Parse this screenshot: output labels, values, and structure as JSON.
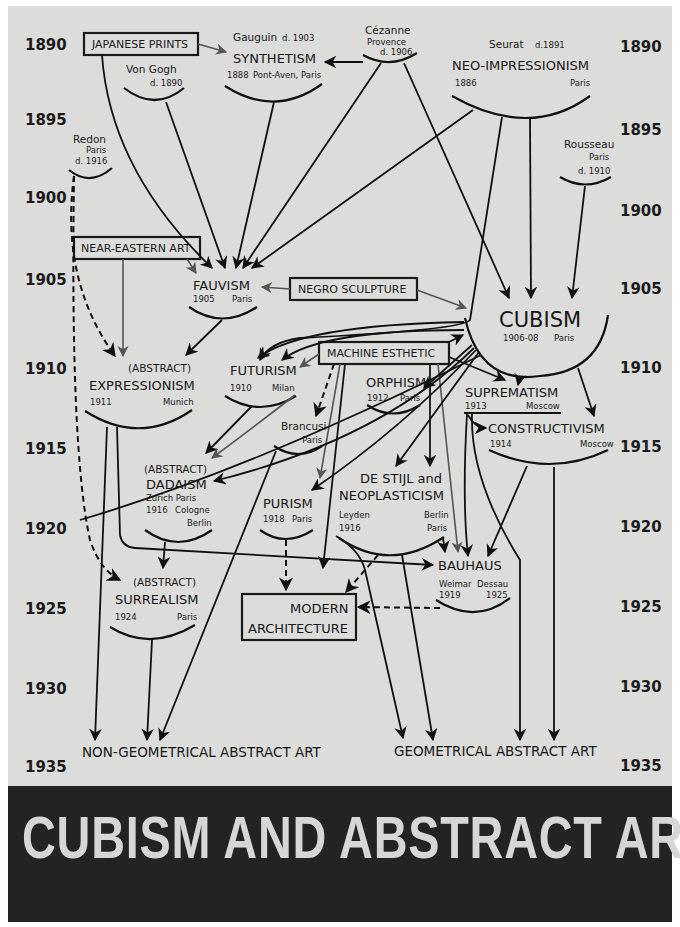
{
  "cover": {
    "title": "CUBISM AND ABSTRACT ART",
    "background_color": "#dcdcda",
    "banner_color": "#232323",
    "title_color": "#d6d6d6"
  },
  "timeline": {
    "left_years": [
      "1890",
      "1895",
      "1900",
      "1905",
      "1910",
      "1915",
      "1920",
      "1925",
      "1930",
      "1935"
    ],
    "right_years": [
      "1890",
      "1895",
      "1900",
      "1905",
      "1910",
      "1915",
      "1920",
      "1925",
      "1930",
      "1935"
    ]
  },
  "external_influences": [
    {
      "id": "japanese_prints",
      "label": "JAPANESE PRINTS"
    },
    {
      "id": "near_eastern_art",
      "label": "NEAR-EASTERN ART"
    },
    {
      "id": "negro_sculpture",
      "label": "NEGRO SCULPTURE"
    },
    {
      "id": "machine_esthetic",
      "label": "MACHINE ESTHETIC"
    },
    {
      "id": "modern_architecture",
      "label_line1": "MODERN",
      "label_line2": "ARCHITECTURE"
    }
  ],
  "artists": {
    "van_gogh": {
      "name": "Von Gogh",
      "detail": "d. 1890"
    },
    "gauguin": {
      "name": "Gauguin",
      "detail": "d. 1903"
    },
    "cezanne": {
      "name": "Cézanne",
      "place": "Provence",
      "detail": "d. 1906"
    },
    "seurat": {
      "name": "Seurat",
      "detail": "d.1891"
    },
    "redon": {
      "name": "Redon",
      "place": "Paris",
      "detail": "d. 1916"
    },
    "rousseau": {
      "name": "Rousseau",
      "place": "Paris",
      "detail": "d. 1910"
    },
    "brancusi": {
      "name": "Brancusi",
      "place": "Paris"
    }
  },
  "movements": {
    "synthetism": {
      "name": "SYNTHETISM",
      "year": "1888",
      "place": "Pont-Aven, Paris"
    },
    "neo_impressionism": {
      "name": "NEO-IMPRESSIONISM",
      "year": "1886",
      "place": "Paris"
    },
    "fauvism": {
      "name": "FAUVISM",
      "year": "1905",
      "place": "Paris"
    },
    "cubism": {
      "name": "CUBISM",
      "year": "1906-08",
      "place": "Paris"
    },
    "expressionism": {
      "prefix": "(ABSTRACT)",
      "name": "EXPRESSIONISM",
      "year": "1911",
      "place": "Munich"
    },
    "futurism": {
      "name": "FUTURISM",
      "year": "1910",
      "place": "Milan"
    },
    "orphism": {
      "name": "ORPHISM",
      "year": "1912",
      "place": "Paris"
    },
    "suprematism": {
      "name": "SUPREMATISM",
      "year": "1913",
      "place": "Moscow"
    },
    "constructivism": {
      "name": "CONSTRUCTIVISM",
      "year": "1914",
      "place": "Moscow"
    },
    "dadaism": {
      "prefix": "(ABSTRACT)",
      "name": "DADAISM",
      "places_line1": "Zurich   Paris",
      "year": "1916",
      "places_line2": "Cologne",
      "places_line3": "Berlin"
    },
    "purism": {
      "name": "PURISM",
      "year": "1918",
      "place": "Paris"
    },
    "de_stijl": {
      "name_line1": "DE STIJL and",
      "name_line2": "NEOPLASTICISM",
      "place_left": "Leyden",
      "year": "1916",
      "place_right1": "Berlin",
      "place_right2": "Paris"
    },
    "bauhaus": {
      "name": "BAUHAUS",
      "place_left": "Weimar",
      "place_right": "Dessau",
      "year_left": "1919",
      "year_right": "1925"
    },
    "surrealism": {
      "prefix": "(ABSTRACT)",
      "name": "SURREALISM",
      "year": "1924",
      "place": "Paris"
    }
  },
  "outcomes": {
    "non_geometrical": "NON-GEOMETRICAL ABSTRACT ART",
    "geometrical": "GEOMETRICAL ABSTRACT ART"
  }
}
